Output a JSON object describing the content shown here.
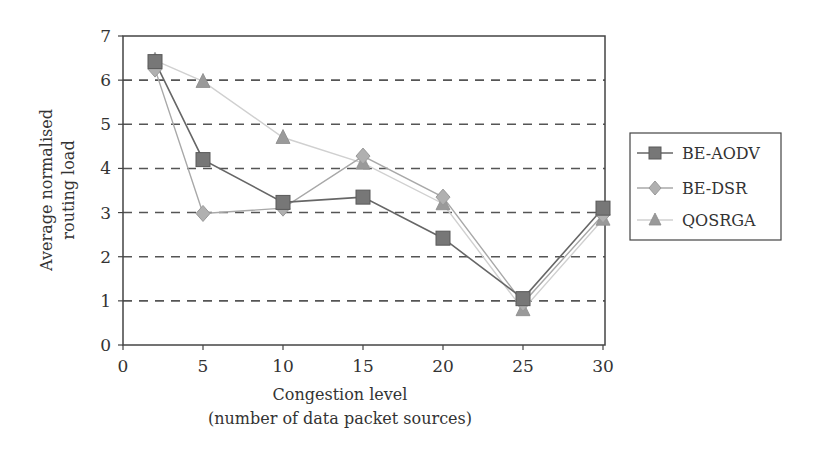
{
  "chart_data": {
    "type": "line",
    "title": "",
    "xlabel": "Congestion level",
    "xlabel_sub": "(number of data packet sources)",
    "ylabel": "Average normalised",
    "ylabel_sub": "routing load",
    "x": [
      2,
      5,
      10,
      15,
      20,
      25,
      30
    ],
    "xlim": [
      0,
      30
    ],
    "ylim": [
      0,
      7
    ],
    "xticks": [
      0,
      5,
      10,
      15,
      20,
      25,
      30
    ],
    "yticks": [
      0,
      1,
      2,
      3,
      4,
      5,
      6,
      7
    ],
    "grid": "horizontal-dashed",
    "legend_position": "right",
    "series": [
      {
        "name": "BE-AODV",
        "marker": "square",
        "color": "#777777",
        "line_color": "#666666",
        "values": [
          6.42,
          4.2,
          3.23,
          3.35,
          2.42,
          1.05,
          3.1
        ]
      },
      {
        "name": "BE-DSR",
        "marker": "diamond",
        "color": "#b0b0b0",
        "line_color": "#a8a8a8",
        "values": [
          6.25,
          2.98,
          3.1,
          4.28,
          3.35,
          0.95,
          2.95
        ]
      },
      {
        "name": "QOSRGA",
        "marker": "triangle",
        "color": "#9a9a9a",
        "line_color": "#d0d0d0",
        "values": [
          6.45,
          5.97,
          4.7,
          4.12,
          3.2,
          0.8,
          2.85
        ]
      }
    ]
  },
  "legend": {
    "items": [
      "BE-AODV",
      "BE-DSR",
      "QOSRGA"
    ]
  },
  "axes": {
    "x_title": "Congestion level",
    "x_subtitle": "(number of data packet sources)",
    "y_title_line1": "Average normalised",
    "y_title_line2": "routing load"
  }
}
